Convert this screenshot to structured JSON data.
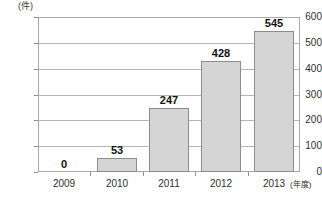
{
  "chart_data": {
    "type": "bar",
    "title": "",
    "subtitle": "",
    "categories": [
      "2009",
      "2010",
      "2011",
      "2012",
      "2013"
    ],
    "values": [
      0,
      53,
      247,
      428,
      545
    ],
    "data_labels": [
      "0",
      "53",
      "247",
      "428",
      "545"
    ],
    "xlabel": "(年度)",
    "ylabel": "(件)",
    "ylim": [
      0,
      600
    ],
    "ytick_values": [
      600,
      500,
      400,
      300,
      200,
      100,
      0
    ],
    "ytick_labels": [
      "600",
      "500",
      "400",
      "300",
      "200",
      "100",
      "0"
    ],
    "grid": true,
    "grid_axis": "y",
    "legend": false,
    "legend_position": "none",
    "series": [
      {
        "name": "",
        "values": [
          0,
          53,
          247,
          428,
          545
        ]
      }
    ],
    "colors": {
      "bar_fill": "#d5d5d5",
      "bar_border": "#8c8c8c",
      "gridline": "#b5b5b5",
      "frame": "#a8a8a8",
      "text": "#2e2e2e",
      "data_label": "#111111",
      "background": "#ffffff"
    }
  }
}
